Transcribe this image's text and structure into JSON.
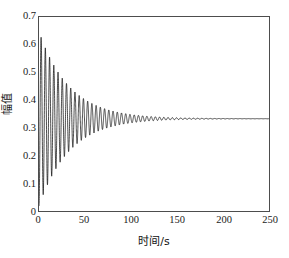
{
  "chart_data": {
    "type": "line",
    "title": "",
    "xlabel": "时间/s",
    "ylabel": "幅值",
    "xlim": [
      0,
      250
    ],
    "ylim": [
      0,
      0.7
    ],
    "xticks": [
      0,
      50,
      100,
      150,
      200,
      250
    ],
    "yticks": [
      0,
      0.1,
      0.2,
      0.3,
      0.4,
      0.5,
      0.6,
      0.7
    ],
    "xtick_labels": [
      "0",
      "50",
      "100",
      "150",
      "200",
      "250"
    ],
    "ytick_labels": [
      "0",
      "0.1",
      "0.2",
      "0.3",
      "0.4",
      "0.5",
      "0.6",
      "0.7"
    ],
    "grid": false,
    "legend": null,
    "legend_position": "none",
    "line_color": "#000000",
    "line_width": 0.8,
    "series": [
      {
        "name": "amplitude",
        "model": "damped_sine",
        "steady_state": 0.333,
        "initial_amplitude": 0.315,
        "decay_time_constant": 33.0,
        "period": 4.6,
        "phase_deg": -90,
        "first_peak_value": 0.645,
        "first_peak_time": 3.0,
        "first_trough_value": 0.04,
        "first_trough_time": 5.3,
        "settling_time": 165,
        "samples": [
          {
            "t": 0,
            "y": 0.333
          },
          {
            "t": 1.2,
            "y": 0.52
          },
          {
            "t": 3.0,
            "y": 0.645
          },
          {
            "t": 5.3,
            "y": 0.04
          },
          {
            "t": 7.6,
            "y": 0.61
          },
          {
            "t": 9.9,
            "y": 0.075
          },
          {
            "t": 12.2,
            "y": 0.585
          },
          {
            "t": 14.5,
            "y": 0.105
          },
          {
            "t": 19.1,
            "y": 0.135
          },
          {
            "t": 25.0,
            "y": 0.165
          },
          {
            "t": 30.0,
            "y": 0.5
          },
          {
            "t": 40.0,
            "y": 0.215
          },
          {
            "t": 50.0,
            "y": 0.445
          },
          {
            "t": 60.0,
            "y": 0.255
          },
          {
            "t": 75.0,
            "y": 0.405
          },
          {
            "t": 90.0,
            "y": 0.285
          },
          {
            "t": 100.0,
            "y": 0.382
          },
          {
            "t": 120.0,
            "y": 0.305
          },
          {
            "t": 140.0,
            "y": 0.355
          },
          {
            "t": 160.0,
            "y": 0.326
          },
          {
            "t": 180.0,
            "y": 0.336
          },
          {
            "t": 200.0,
            "y": 0.333
          },
          {
            "t": 225.0,
            "y": 0.333
          },
          {
            "t": 250.0,
            "y": 0.333
          }
        ]
      }
    ]
  }
}
